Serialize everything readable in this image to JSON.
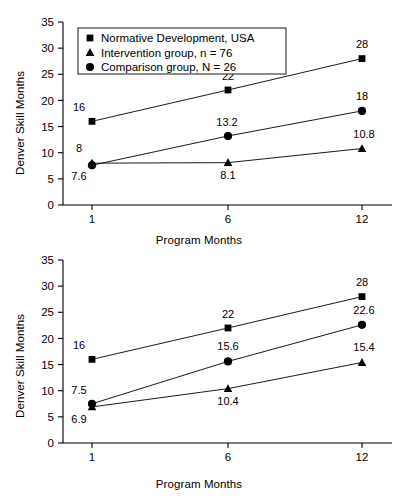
{
  "page_header": {
    "left": "",
    "right": ""
  },
  "legend": {
    "items": [
      {
        "marker": "square",
        "label": "Normative Development, USA"
      },
      {
        "marker": "triangle",
        "label": "Intervention group, n = 76"
      },
      {
        "marker": "circle",
        "label": "Comparison group, N = 26"
      }
    ]
  },
  "axis": {
    "ylabel": "Denver Skill Months",
    "xlabel": "Program Months",
    "yticks": [
      "0",
      "5",
      "10",
      "15",
      "20",
      "25",
      "30",
      "35"
    ],
    "xticks": [
      "1",
      "6",
      "12"
    ]
  },
  "chart_data": [
    {
      "type": "line",
      "title": "",
      "xlabel": "Program Months",
      "ylabel": "Denver Skill Months",
      "x": [
        1,
        6,
        12
      ],
      "xtick_labels": [
        "1",
        "6",
        "12"
      ],
      "ylim": [
        0,
        35
      ],
      "yticks": [
        0,
        5,
        10,
        15,
        20,
        25,
        30,
        35
      ],
      "grid": false,
      "legend_position": "top-left",
      "series": [
        {
          "name": "Normative Development, USA",
          "marker": "square",
          "values": [
            16,
            22,
            28
          ],
          "labels": [
            "16",
            "22",
            "28"
          ]
        },
        {
          "name": "Comparison group, N = 26",
          "marker": "circle",
          "values": [
            7.6,
            13.2,
            18
          ],
          "labels": [
            "7.6",
            "13.2",
            "18"
          ]
        },
        {
          "name": "Intervention group, n = 76",
          "marker": "triangle",
          "values": [
            8,
            8.1,
            10.8
          ],
          "labels": [
            "8",
            "8.1",
            "10.8"
          ]
        }
      ]
    },
    {
      "type": "line",
      "title": "",
      "xlabel": "Program Months",
      "ylabel": "Denver Skill Months",
      "x": [
        1,
        6,
        12
      ],
      "xtick_labels": [
        "1",
        "6",
        "12"
      ],
      "ylim": [
        0,
        35
      ],
      "yticks": [
        0,
        5,
        10,
        15,
        20,
        25,
        30,
        35
      ],
      "grid": false,
      "legend_position": "none",
      "series": [
        {
          "name": "Normative Development, USA",
          "marker": "square",
          "values": [
            16,
            22,
            28
          ],
          "labels": [
            "16",
            "22",
            "28"
          ]
        },
        {
          "name": "Comparison group, N = 26",
          "marker": "circle",
          "values": [
            7.5,
            15.6,
            22.6
          ],
          "labels": [
            "7.5",
            "15.6",
            "22.6"
          ]
        },
        {
          "name": "Intervention group, n = 76",
          "marker": "triangle",
          "values": [
            6.9,
            10.4,
            15.4
          ],
          "labels": [
            "6.9",
            "10.4",
            "15.4"
          ]
        }
      ]
    }
  ]
}
